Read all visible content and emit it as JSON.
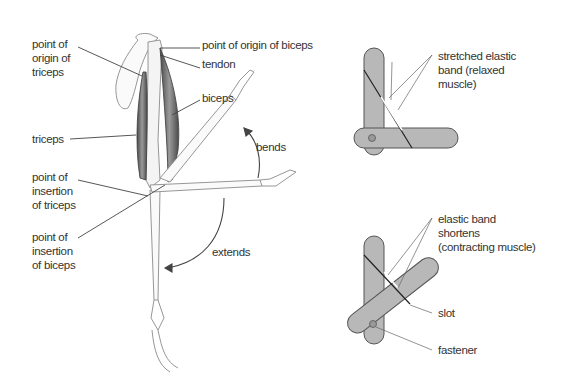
{
  "left_diagram": {
    "title": "arm muscles",
    "labels": {
      "origin_triceps": "point of\norigin of\ntriceps",
      "origin_biceps": "point of origin of biceps",
      "tendon": "tendon",
      "biceps": "biceps",
      "triceps": "triceps",
      "bends": "bends",
      "insertion_triceps": "point of\ninsertion\nof triceps",
      "insertion_biceps": "point of\ninsertion\nof biceps",
      "extends": "extends"
    }
  },
  "right_diagram": {
    "top_model": {
      "label": "stretched elastic\nband (relaxed\nmuscle)"
    },
    "bottom_model": {
      "label": "elastic band\nshortens\n(contracting muscle)",
      "slot": "slot",
      "fastener": "fastener"
    }
  },
  "colors": {
    "stick_fill": "#b8b8b8",
    "stick_stroke": "#555555",
    "line": "#555555",
    "muscle": "#6a6a6a"
  }
}
